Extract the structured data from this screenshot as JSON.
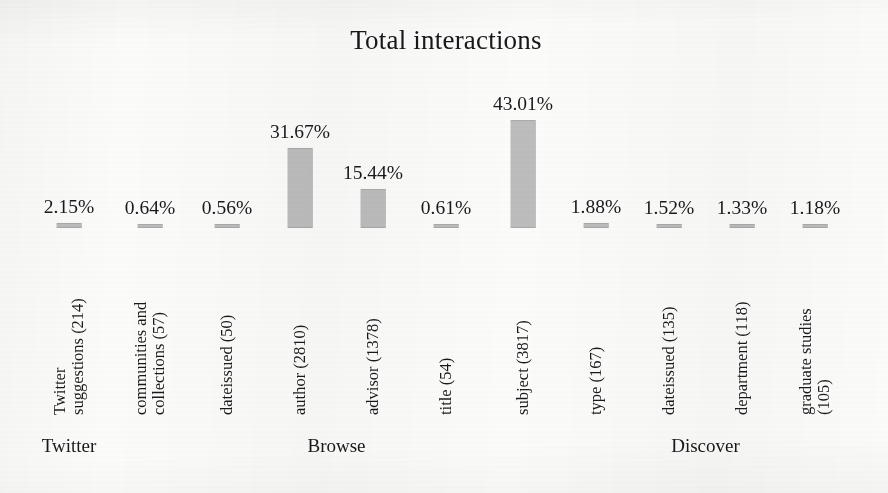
{
  "chart_data": {
    "type": "bar",
    "title": "Total interactions",
    "xlabel": "",
    "ylabel": "",
    "ylim": [
      0,
      50
    ],
    "grid": false,
    "legend": "none",
    "categories": [
      "Twitter suggestions (214)",
      "communities and collections (57)",
      "dateissued (50)",
      "author (2810)",
      "advisor (1378)",
      "title (54)",
      "subject (3817)",
      "type (167)",
      "dateissued (135)",
      "department (118)",
      "graduate studies (105)"
    ],
    "values": [
      2.15,
      0.64,
      0.56,
      31.67,
      15.44,
      0.61,
      43.01,
      1.88,
      1.52,
      1.33,
      1.18
    ],
    "value_labels": [
      "2.15%",
      "0.64%",
      "0.56%",
      "31.67%",
      "15.44%",
      "0.61%",
      "43.01%",
      "1.88%",
      "1.52%",
      "1.33%",
      "1.18%"
    ],
    "counts": [
      214,
      57,
      50,
      2810,
      1378,
      54,
      3817,
      167,
      135,
      118,
      105
    ],
    "bar_color": "#bcbcbc",
    "background_color": "#fbfbfa",
    "groups": [
      {
        "label": "Twitter",
        "bars": [
          0
        ]
      },
      {
        "label": "Browse",
        "bars": [
          1,
          2,
          3,
          4,
          5,
          6
        ]
      },
      {
        "label": "Discover",
        "bars": [
          7,
          8,
          9,
          10
        ]
      }
    ]
  },
  "bars": [
    {
      "value_label": "2.15%",
      "category_lines": [
        "Twitter",
        "suggestions (214)"
      ]
    },
    {
      "value_label": "0.64%",
      "category_lines": [
        "communities and",
        "collections (57)"
      ]
    },
    {
      "value_label": "0.56%",
      "category_lines": [
        "dateissued (50)"
      ]
    },
    {
      "value_label": "31.67%",
      "category_lines": [
        "author (2810)"
      ]
    },
    {
      "value_label": "15.44%",
      "category_lines": [
        "advisor (1378)"
      ]
    },
    {
      "value_label": "0.61%",
      "category_lines": [
        "title (54)"
      ]
    },
    {
      "value_label": "43.01%",
      "category_lines": [
        "subject (3817)"
      ]
    },
    {
      "value_label": "1.88%",
      "category_lines": [
        "type (167)"
      ]
    },
    {
      "value_label": "1.52%",
      "category_lines": [
        "dateissued (135)"
      ]
    },
    {
      "value_label": "1.33%",
      "category_lines": [
        "department (118)"
      ]
    },
    {
      "value_label": "1.18%",
      "category_lines": [
        "graduate studies",
        "(105)"
      ]
    }
  ],
  "groups": [
    {
      "label": "Twitter"
    },
    {
      "label": "Browse"
    },
    {
      "label": "Discover"
    }
  ]
}
